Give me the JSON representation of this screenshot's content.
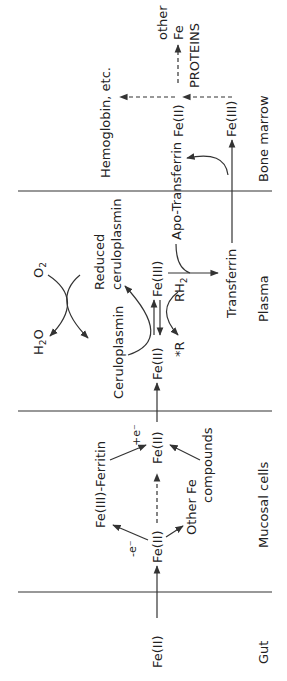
{
  "figure": {
    "orientation": "rotated-90-ccw"
  },
  "compartments": {
    "gut": "Gut",
    "mucosal": "Mucosal cells",
    "plasma": "Plasma",
    "bone_marrow": "Bone marrow"
  },
  "gut": {
    "fe2": "Fe(II)"
  },
  "mucosal": {
    "fe2_entry": "Fe(II)",
    "minus_e": "-e⁻",
    "ferritin": "Fe(III)-Ferritin",
    "plus_e": "+e⁻",
    "other_fe_1": "Other Fe",
    "other_fe_2": "compounds",
    "fe2_exit": "Fe(II)"
  },
  "plasma": {
    "fe2": "Fe(II)",
    "ceruloplasmin": "Ceruloplasmin",
    "reduced_1": "Reduced",
    "reduced_2": "ceruloplasmin",
    "o2": "O",
    "o2_sub": "2",
    "h2o_h": "H",
    "h2o_sub": "2",
    "h2o_o": "O",
    "fe3": "Fe(III)",
    "rh2": "RH",
    "rh2_sub": "2",
    "r_star": "*R",
    "apo_transferrin": "Apo-Transferrin",
    "transferrin": "Transferrin"
  },
  "bone_marrow": {
    "fe3": "Fe(III)",
    "fe2": "Fe(II)",
    "hemoglobin": "Hemoglobin, etc.",
    "other_1": "other",
    "other_fe": "Fe",
    "proteins": "PROTEINS"
  }
}
